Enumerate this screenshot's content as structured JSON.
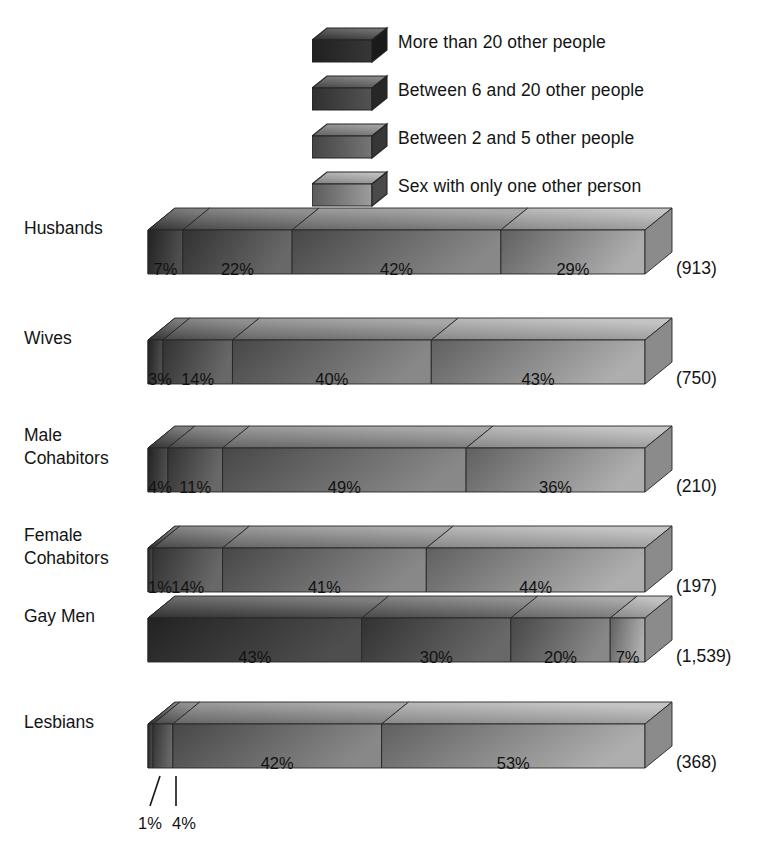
{
  "legend": {
    "items": [
      {
        "label": "More than 20 other people",
        "swatch": "legend-swatch-box",
        "color": "#3a3a3a"
      },
      {
        "label": "Between 6 and 20 other people",
        "swatch": "legend-swatch-box",
        "color": "#575757"
      },
      {
        "label": "Between 2 and 5 other people",
        "swatch": "legend-swatch-box",
        "color": "#7b7b7b"
      },
      {
        "label": "Sex with only one other person",
        "swatch": "legend-swatch-box",
        "color": "#a5a5a5"
      }
    ]
  },
  "callouts": {
    "first": "1%",
    "second": "4%"
  },
  "chart_data": {
    "type": "bar",
    "title": "",
    "xlabel": "",
    "ylabel": "",
    "orientation": "horizontal",
    "stacked": true,
    "percent_total": 100,
    "xlim": [
      0,
      100
    ],
    "grid": false,
    "legend_position": "top-right",
    "categories": [
      "Husbands",
      "Wives",
      "Male Cohabitors",
      "Female Cohabitors",
      "Gay Men",
      "Lesbians"
    ],
    "category_counts": [
      "(913)",
      "(750)",
      "(210)",
      "(197)",
      "(1,539)",
      "(368)"
    ],
    "series": [
      {
        "name": "More than 20 other people",
        "values": [
          7,
          3,
          4,
          1,
          43,
          1
        ]
      },
      {
        "name": "Between 6 and 20 other people",
        "values": [
          22,
          14,
          11,
          14,
          30,
          4
        ]
      },
      {
        "name": "Between 2 and 5 other people",
        "values": [
          42,
          40,
          49,
          41,
          20,
          42
        ]
      },
      {
        "name": "Sex with only one other person",
        "values": [
          29,
          43,
          36,
          44,
          7,
          53
        ]
      }
    ],
    "rows": [
      {
        "label": "Husbands",
        "label_lines": [
          "Husbands"
        ],
        "n": "(913)",
        "segments": [
          {
            "pct": 7,
            "text": "7%",
            "inside": true
          },
          {
            "pct": 22,
            "text": "22%",
            "inside": true
          },
          {
            "pct": 42,
            "text": "42%",
            "inside": true
          },
          {
            "pct": 29,
            "text": "29%",
            "inside": true
          }
        ]
      },
      {
        "label": "Wives",
        "label_lines": [
          "Wives"
        ],
        "n": "(750)",
        "segments": [
          {
            "pct": 3,
            "text": "3%",
            "inside": true
          },
          {
            "pct": 14,
            "text": "14%",
            "inside": true
          },
          {
            "pct": 40,
            "text": "40%",
            "inside": true
          },
          {
            "pct": 43,
            "text": "43%",
            "inside": true
          }
        ]
      },
      {
        "label": "Male Cohabitors",
        "label_lines": [
          "Male",
          "Cohabitors"
        ],
        "n": "(210)",
        "segments": [
          {
            "pct": 4,
            "text": "4%",
            "inside": true
          },
          {
            "pct": 11,
            "text": "11%",
            "inside": true
          },
          {
            "pct": 49,
            "text": "49%",
            "inside": true
          },
          {
            "pct": 36,
            "text": "36%",
            "inside": true
          }
        ]
      },
      {
        "label": "Female Cohabitors",
        "label_lines": [
          "Female",
          "Cohabitors"
        ],
        "n": "(197)",
        "segments": [
          {
            "pct": 1,
            "text": "1%",
            "inside": true
          },
          {
            "pct": 14,
            "text": "14%",
            "inside": true
          },
          {
            "pct": 41,
            "text": "41%",
            "inside": true
          },
          {
            "pct": 44,
            "text": "44%",
            "inside": true
          }
        ]
      },
      {
        "label": "Gay Men",
        "label_lines": [
          "Gay Men"
        ],
        "n": "(1,539)",
        "segments": [
          {
            "pct": 43,
            "text": "43%",
            "inside": true
          },
          {
            "pct": 30,
            "text": "30%",
            "inside": true
          },
          {
            "pct": 20,
            "text": "20%",
            "inside": true
          },
          {
            "pct": 7,
            "text": "7%",
            "inside": true
          }
        ]
      },
      {
        "label": "Lesbians",
        "label_lines": [
          "Lesbians"
        ],
        "n": "(368)",
        "segments": [
          {
            "pct": 1,
            "text": "1%",
            "inside": false
          },
          {
            "pct": 4,
            "text": "4%",
            "inside": false
          },
          {
            "pct": 42,
            "text": "42%",
            "inside": true
          },
          {
            "pct": 53,
            "text": "53%",
            "inside": true
          }
        ]
      }
    ],
    "segment_colors": [
      "#3a3a3a",
      "#575757",
      "#7b7b7b",
      "#a5a5a5"
    ]
  }
}
